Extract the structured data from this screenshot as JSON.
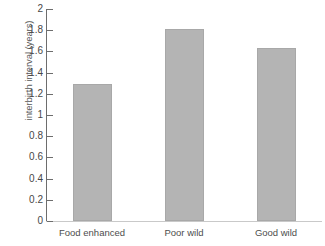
{
  "chart_data": {
    "type": "bar",
    "title": "",
    "subtitle": "",
    "xlabel": "",
    "ylabel": "interbirth interval (years)",
    "categories": [
      "Food enhanced",
      "Poor wild",
      "Good wild"
    ],
    "values": [
      1.29,
      1.81,
      1.63
    ],
    "ylim": [
      0,
      2
    ],
    "xlim": [
      0,
      3
    ],
    "ytick_labels": [
      "0",
      "0.2",
      "0.4",
      "0.6",
      "0.8",
      "1",
      "1.2",
      "1.4",
      "1.6",
      "1.8",
      "2"
    ],
    "ytick_values": [
      0,
      0.2,
      0.4,
      0.6,
      0.8,
      1,
      1.2,
      1.4,
      1.6,
      1.8,
      2
    ],
    "grid": false,
    "legend": null,
    "legend_position": "none",
    "annotations": [],
    "bar_color": "#b4b4b4",
    "bar_edge_color": "#a8a8a8",
    "axis_color": "#6d6d6d",
    "background_color": "#ffffff"
  }
}
